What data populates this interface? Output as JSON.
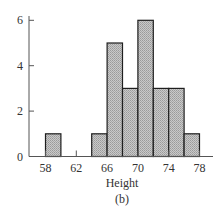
{
  "chart_data": {
    "type": "bar",
    "subtype": "histogram",
    "title": "",
    "caption": "(b)",
    "xlabel": "Height",
    "ylabel": "",
    "bins": [
      {
        "start": 58,
        "end": 60,
        "count": 1
      },
      {
        "start": 60,
        "end": 62,
        "count": 0
      },
      {
        "start": 62,
        "end": 64,
        "count": 0
      },
      {
        "start": 64,
        "end": 66,
        "count": 1
      },
      {
        "start": 66,
        "end": 68,
        "count": 5
      },
      {
        "start": 68,
        "end": 70,
        "count": 3
      },
      {
        "start": 70,
        "end": 72,
        "count": 6
      },
      {
        "start": 72,
        "end": 74,
        "count": 3
      },
      {
        "start": 74,
        "end": 76,
        "count": 3
      },
      {
        "start": 76,
        "end": 78,
        "count": 1
      }
    ],
    "xticks": [
      58,
      62,
      66,
      70,
      74,
      78
    ],
    "yticks": [
      0,
      2,
      4,
      6
    ],
    "xlim": [
      56,
      80
    ],
    "ylim": [
      0,
      6.2
    ],
    "grid": false,
    "legend": "none",
    "bar_color": "#b8b8b8",
    "bar_edge_color": "#1e1e1e"
  }
}
